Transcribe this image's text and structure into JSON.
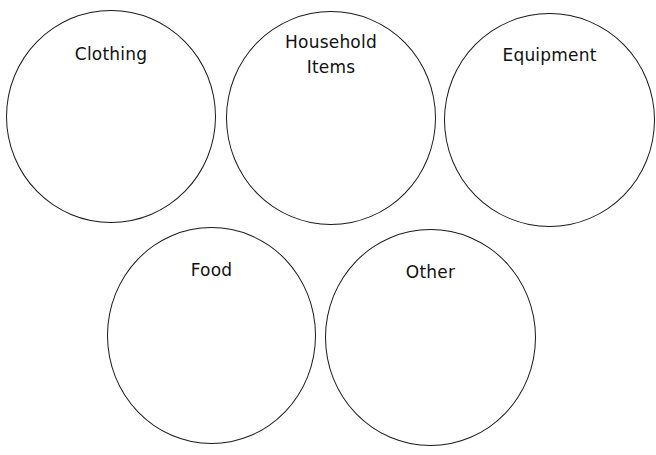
{
  "diagram": {
    "type": "category-circles",
    "stroke_color": "#1a1a1a",
    "background": "#ffffff",
    "circles": [
      {
        "id": "clothing",
        "label": "Clothing",
        "lines": [
          "Clothing"
        ]
      },
      {
        "id": "household-items",
        "label": "Household Items",
        "lines": [
          "Household",
          "Items"
        ]
      },
      {
        "id": "equipment",
        "label": "Equipment",
        "lines": [
          "Equipment"
        ]
      },
      {
        "id": "food",
        "label": "Food",
        "lines": [
          "Food"
        ]
      },
      {
        "id": "other",
        "label": "Other",
        "lines": [
          "Other"
        ]
      }
    ]
  }
}
